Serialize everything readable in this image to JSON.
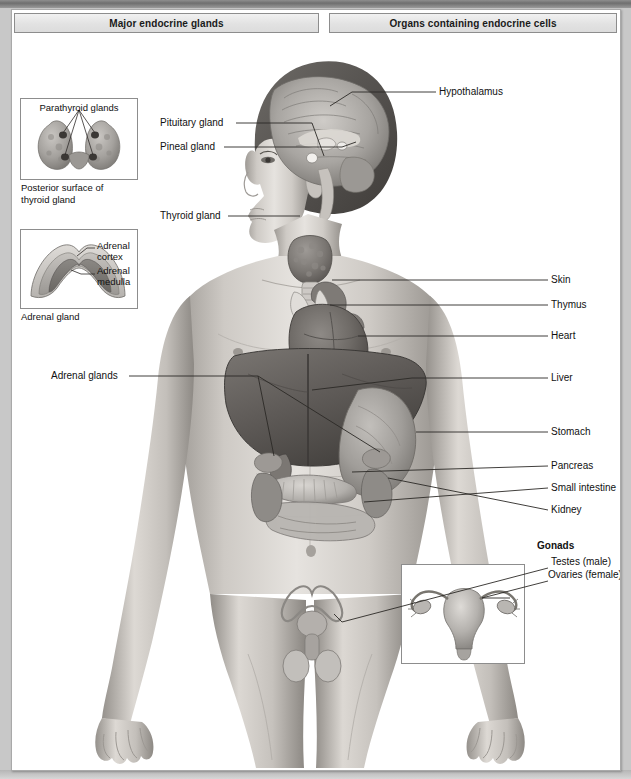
{
  "headers": {
    "left": "Major endocrine glands",
    "right": "Organs containing endocrine cells"
  },
  "insets": {
    "parathyroid": {
      "title": "Parathyroid glands",
      "caption": "Posterior surface of\nthyroid gland"
    },
    "adrenal": {
      "label_cortex": "Adrenal\ncortex",
      "label_medulla": "Adrenal\nmedulla",
      "caption": "Adrenal gland"
    },
    "uterus": {
      "name": "female-reproductive-inset"
    }
  },
  "labels_left": [
    {
      "id": "pituitary-gland",
      "text": "Pituitary gland",
      "x": 148,
      "y": 113
    },
    {
      "id": "pineal-gland",
      "text": "Pineal gland",
      "x": 148,
      "y": 137
    },
    {
      "id": "thyroid-gland",
      "text": "Thyroid gland",
      "x": 148,
      "y": 206
    },
    {
      "id": "adrenal-glands",
      "text": "Adrenal glands",
      "x": 39,
      "y": 366
    }
  ],
  "labels_right": [
    {
      "id": "hypothalamus",
      "text": "Hypothalamus",
      "x": 427,
      "y": 82
    },
    {
      "id": "skin",
      "text": "Skin",
      "x": 539,
      "y": 270
    },
    {
      "id": "thymus",
      "text": "Thymus",
      "x": 539,
      "y": 295
    },
    {
      "id": "heart",
      "text": "Heart",
      "x": 539,
      "y": 326
    },
    {
      "id": "liver",
      "text": "Liver",
      "x": 539,
      "y": 368
    },
    {
      "id": "stomach",
      "text": "Stomach",
      "x": 539,
      "y": 422
    },
    {
      "id": "pancreas",
      "text": "Pancreas",
      "x": 539,
      "y": 456
    },
    {
      "id": "small-intestine",
      "text": "Small intestine",
      "x": 539,
      "y": 478
    },
    {
      "id": "kidney",
      "text": "Kidney",
      "x": 539,
      "y": 500
    }
  ],
  "gonads": {
    "heading": "Gonads",
    "testes": "Testes (male)",
    "ovaries": "Ovaries (female)"
  },
  "colors": {
    "page_background": "#c8c8c8",
    "sheet": "#ffffff",
    "header_bar": "#e2e2e2",
    "border": "#8d8d8d",
    "leader_line": "#3a3a3a",
    "text": "#111111",
    "skin_light": "#e3e0dc",
    "skin_mid": "#bdb8b2",
    "skin_dark": "#8e8a85",
    "organ_dark": "#6a6a6a",
    "organ_mid": "#909090",
    "organ_light": "#b5b5b5"
  }
}
